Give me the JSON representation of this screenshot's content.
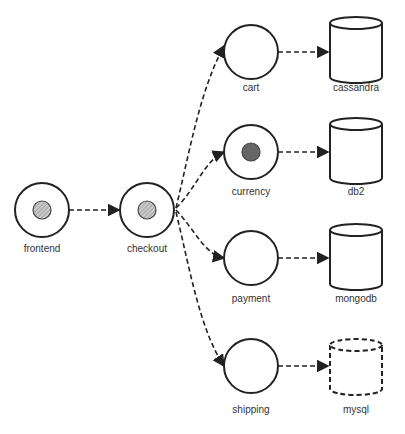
{
  "diagram": {
    "nodes": [
      {
        "id": "frontend",
        "label": "frontend",
        "shape": "circle",
        "inner": "hatched"
      },
      {
        "id": "checkout",
        "label": "checkout",
        "shape": "circle",
        "inner": "hatched"
      },
      {
        "id": "cart",
        "label": "cart",
        "shape": "circle",
        "inner": "none"
      },
      {
        "id": "currency",
        "label": "currency",
        "shape": "circle",
        "inner": "filled"
      },
      {
        "id": "payment",
        "label": "payment",
        "shape": "circle",
        "inner": "none"
      },
      {
        "id": "shipping",
        "label": "shipping",
        "shape": "circle",
        "inner": "none"
      },
      {
        "id": "cassandra",
        "label": "cassandra",
        "shape": "cylinder",
        "border": "solid"
      },
      {
        "id": "db2",
        "label": "db2",
        "shape": "cylinder",
        "border": "solid"
      },
      {
        "id": "mongodb",
        "label": "mongodb",
        "shape": "cylinder",
        "border": "solid"
      },
      {
        "id": "mysql",
        "label": "mysql",
        "shape": "cylinder",
        "border": "dashed"
      }
    ],
    "edges": [
      {
        "from": "frontend",
        "to": "checkout",
        "style": "dashed"
      },
      {
        "from": "checkout",
        "to": "cart",
        "style": "dashed"
      },
      {
        "from": "checkout",
        "to": "currency",
        "style": "dashed"
      },
      {
        "from": "checkout",
        "to": "payment",
        "style": "dashed"
      },
      {
        "from": "checkout",
        "to": "shipping",
        "style": "dashed"
      },
      {
        "from": "cart",
        "to": "cassandra",
        "style": "dashed"
      },
      {
        "from": "currency",
        "to": "db2",
        "style": "dashed"
      },
      {
        "from": "payment",
        "to": "mongodb",
        "style": "dashed"
      },
      {
        "from": "shipping",
        "to": "mysql",
        "style": "dashed"
      }
    ]
  },
  "labels": {
    "frontend": "frontend",
    "checkout": "checkout",
    "cart": "cart",
    "currency": "currency",
    "payment": "payment",
    "shipping": "shipping",
    "cassandra": "cassandra",
    "db2": "db2",
    "mongodb": "mongodb",
    "mysql": "mysql"
  },
  "colors": {
    "stroke": "#222222",
    "filled_dot": "#666666",
    "hatch": "#999999"
  }
}
